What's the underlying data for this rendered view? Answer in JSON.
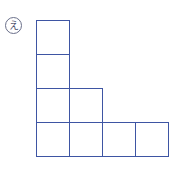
{
  "figure": {
    "label": "え",
    "line_color": "#3e55a3",
    "cell_size": 33,
    "origin": [
      36,
      20
    ],
    "cells": [
      {
        "row": 0,
        "col": 0
      },
      {
        "row": 1,
        "col": 0
      },
      {
        "row": 2,
        "col": 0
      },
      {
        "row": 2,
        "col": 1
      },
      {
        "row": 3,
        "col": 0
      },
      {
        "row": 3,
        "col": 1
      },
      {
        "row": 3,
        "col": 2
      },
      {
        "row": 3,
        "col": 3
      }
    ]
  }
}
